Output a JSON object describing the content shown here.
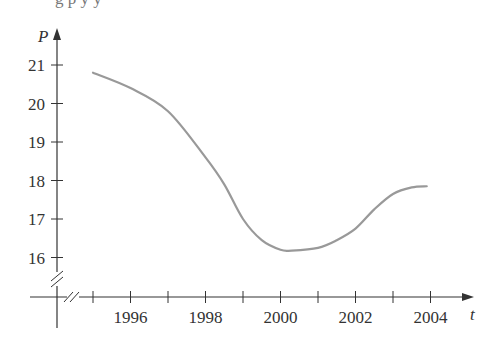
{
  "chart_data": {
    "type": "line",
    "title": "",
    "xlabel": "t",
    "ylabel": "P",
    "x_ticks": [
      1995,
      1996,
      1997,
      1998,
      1999,
      2000,
      2001,
      2002,
      2003,
      2004
    ],
    "x_tick_labels": [
      "1996",
      "1998",
      "2000",
      "2002",
      "2004"
    ],
    "y_ticks": [
      16,
      17,
      18,
      19,
      20,
      21
    ],
    "y_tick_labels": [
      "16",
      "17",
      "18",
      "19",
      "20",
      "21"
    ],
    "xlim": [
      1994,
      2005
    ],
    "ylim": [
      15,
      21.5
    ],
    "axis_breaks": {
      "x": true,
      "y": true
    },
    "grid": false,
    "legend": null,
    "series": [
      {
        "name": "P(t)",
        "color": "#999999",
        "x": [
          1995.0,
          1996.0,
          1997.0,
          1998.0,
          1998.5,
          1999.0,
          1999.5,
          2000.0,
          2000.3,
          2001.0,
          2001.5,
          2002.0,
          2002.5,
          2003.0,
          2003.5,
          2003.9
        ],
        "values": [
          20.8,
          20.4,
          19.8,
          18.6,
          17.9,
          17.0,
          16.45,
          16.2,
          16.18,
          16.25,
          16.45,
          16.75,
          17.25,
          17.65,
          17.82,
          17.85
        ]
      }
    ]
  },
  "page": {
    "cut_off_text": "g          p        y                                      y"
  },
  "axes": {
    "x_label": "t",
    "y_label": "P",
    "axis_color": "#333333",
    "curve_color": "#999999"
  }
}
